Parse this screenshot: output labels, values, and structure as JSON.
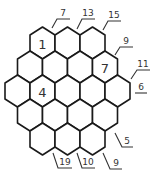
{
  "puzzle": {
    "type": "hexagonal-sum-grid",
    "rows": [
      {
        "cells": [
          {
            "value": "1"
          },
          {
            "value": ""
          },
          {
            "value": ""
          }
        ]
      },
      {
        "cells": [
          {
            "value": ""
          },
          {
            "value": ""
          },
          {
            "value": ""
          },
          {
            "value": "7"
          }
        ]
      },
      {
        "cells": [
          {
            "value": ""
          },
          {
            "value": "4"
          },
          {
            "value": ""
          },
          {
            "value": ""
          },
          {
            "value": ""
          }
        ]
      },
      {
        "cells": [
          {
            "value": ""
          },
          {
            "value": ""
          },
          {
            "value": ""
          },
          {
            "value": ""
          }
        ]
      },
      {
        "cells": [
          {
            "value": ""
          },
          {
            "value": ""
          },
          {
            "value": ""
          }
        ]
      }
    ],
    "clues": [
      {
        "label": "7",
        "position": "top"
      },
      {
        "label": "13",
        "position": "top"
      },
      {
        "label": "15",
        "position": "top"
      },
      {
        "label": "9",
        "position": "right-upper"
      },
      {
        "label": "11",
        "position": "right-upper"
      },
      {
        "label": "6",
        "position": "right"
      },
      {
        "label": "5",
        "position": "right-lower"
      },
      {
        "label": "9",
        "position": "bottom"
      },
      {
        "label": "10",
        "position": "bottom"
      },
      {
        "label": "19",
        "position": "bottom"
      }
    ]
  }
}
